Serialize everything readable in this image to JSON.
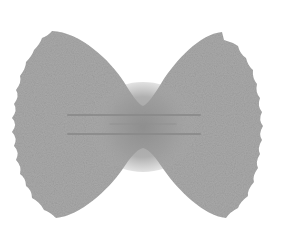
{
  "image": {
    "subject": "farfalle pasta (bow-tie)",
    "style": "grayscale illustration",
    "background_color": "#ffffff",
    "pasta_color": "#a9a9a9",
    "center_shade_color": "#8c8c8c",
    "ridge_color": "#8a8a8a"
  }
}
